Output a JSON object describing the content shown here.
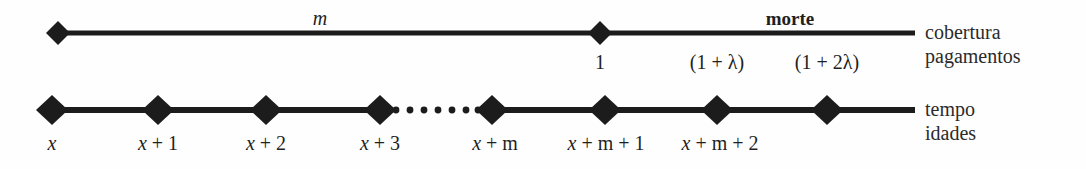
{
  "figure": {
    "name": "actuarial-timeline-diagram",
    "background_color": "#fefefe",
    "line_color": "#1c1c1c",
    "text_color": "#1f1f1f"
  },
  "coverage_axis": {
    "span_label": "m",
    "event_label": "morte",
    "right_labels": [
      "cobertura",
      "pagamentos"
    ],
    "payment_labels": [
      {
        "text": "1",
        "x": 600
      },
      {
        "text": "(1 + λ)",
        "x": 717
      },
      {
        "text": "(1 + 2λ)",
        "x": 827
      }
    ],
    "markers": [
      {
        "x": 58,
        "y": 33
      },
      {
        "x": 600,
        "y": 33
      }
    ],
    "line": {
      "x1": 58,
      "x2": 915,
      "y": 33
    }
  },
  "time_axis": {
    "right_labels": [
      "tempo",
      "idades"
    ],
    "markers": [
      {
        "x": 52,
        "y": 110,
        "label": "x",
        "label_html": "<span class=\"var\">x</span>"
      },
      {
        "x": 158,
        "y": 110,
        "label": "x + 1",
        "label_html": "<span class=\"var\">x</span> + 1"
      },
      {
        "x": 266,
        "y": 110,
        "label": "x + 2",
        "label_html": "<span class=\"var\">x</span> + 2"
      },
      {
        "x": 380,
        "y": 110,
        "label": "x + 3",
        "label_html": "<span class=\"var\">x</span> + 3"
      },
      {
        "x": 492,
        "y": 110,
        "label": "x + m",
        "label_html": "<span class=\"var\">x</span> + <span class=\"up\">m</span>"
      },
      {
        "x": 605,
        "y": 110,
        "label": "x + m + 1",
        "label_html": "<span class=\"var\">x</span> + <span class=\"up\">m</span> + 1"
      },
      {
        "x": 717,
        "y": 110,
        "label": "x + m + 2",
        "label_html": "<span class=\"var\">x</span> + <span class=\"up\">m</span> + 2"
      },
      {
        "x": 827,
        "y": 110,
        "label": "",
        "label_html": ""
      }
    ],
    "line": {
      "x1": 52,
      "x2": 915,
      "y": 110
    },
    "dotted_segment": {
      "x1": 388,
      "x2": 484,
      "y": 110,
      "dots": 7
    }
  }
}
